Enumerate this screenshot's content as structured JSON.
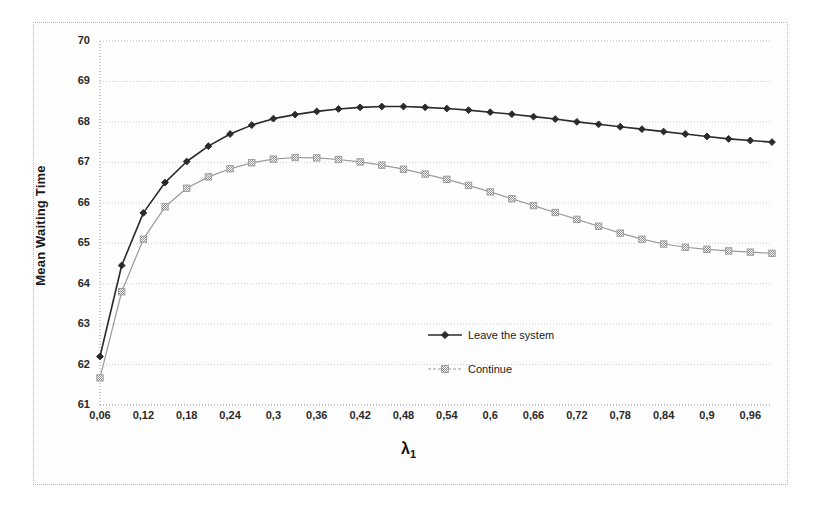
{
  "chart_data": {
    "type": "line",
    "title": "",
    "xlabel": "λ",
    "xlabel_sub": "1",
    "ylabel": "Mean Waiting Time",
    "xlim": [
      0.06,
      0.99
    ],
    "ylim": [
      61,
      70
    ],
    "ytick_step": 1,
    "xtick_step": 0.06,
    "grid": true,
    "legend_position": "inside-center-right",
    "ytick_labels": [
      "61",
      "62",
      "63",
      "64",
      "65",
      "66",
      "67",
      "68",
      "69",
      "70"
    ],
    "ytick_values": [
      61,
      62,
      63,
      64,
      65,
      66,
      67,
      68,
      69,
      70
    ],
    "xtick_labels": [
      "0,06",
      "0,12",
      "0,18",
      "0,24",
      "0,3",
      "0,36",
      "0,42",
      "0,48",
      "0,54",
      "0,6",
      "0,66",
      "0,72",
      "0,78",
      "0,84",
      "0,9",
      "0,96"
    ],
    "xtick_values": [
      0.06,
      0.12,
      0.18,
      0.24,
      0.3,
      0.36,
      0.42,
      0.48,
      0.54,
      0.6,
      0.66,
      0.72,
      0.78,
      0.84,
      0.9,
      0.96
    ],
    "x": [
      0.06,
      0.09,
      0.12,
      0.15,
      0.18,
      0.21,
      0.24,
      0.27,
      0.3,
      0.33,
      0.36,
      0.39,
      0.42,
      0.45,
      0.48,
      0.51,
      0.54,
      0.57,
      0.6,
      0.63,
      0.66,
      0.69,
      0.72,
      0.75,
      0.78,
      0.81,
      0.84,
      0.87,
      0.9,
      0.93,
      0.96,
      0.99
    ],
    "series": [
      {
        "name": "Leave the system",
        "color": "#2b2b2b",
        "marker": "diamond",
        "values": [
          62.2,
          64.45,
          65.75,
          66.5,
          67.02,
          67.4,
          67.7,
          67.92,
          68.08,
          68.18,
          68.26,
          68.32,
          68.36,
          68.38,
          68.38,
          68.36,
          68.33,
          68.29,
          68.24,
          68.19,
          68.13,
          68.07,
          68.0,
          67.94,
          67.88,
          67.82,
          67.76,
          67.7,
          67.64,
          67.58,
          67.54,
          67.5
        ]
      },
      {
        "name": "Continue",
        "color": "#9a9a9a",
        "marker": "square-hatch",
        "values": [
          61.67,
          63.8,
          65.1,
          65.9,
          66.36,
          66.64,
          66.84,
          66.99,
          67.08,
          67.12,
          67.11,
          67.07,
          67.01,
          66.93,
          66.83,
          66.71,
          66.58,
          66.43,
          66.27,
          66.1,
          65.93,
          65.76,
          65.59,
          65.42,
          65.25,
          65.1,
          64.98,
          64.9,
          64.85,
          64.81,
          64.78,
          64.75
        ]
      }
    ]
  },
  "legend": {
    "items": [
      {
        "label": "Leave the system"
      },
      {
        "label": "Continue"
      }
    ]
  }
}
